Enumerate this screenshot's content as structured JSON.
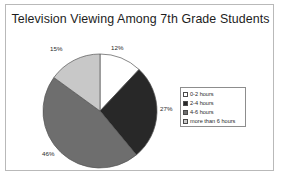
{
  "chart_data": {
    "type": "pie",
    "title": "Television Viewing Among 7th Grade Students",
    "xlabel": "",
    "ylabel": "",
    "legend_position": "right",
    "grid": false,
    "categories": [
      "0-2 hours",
      "2-4 hours",
      "4-6 hours",
      "more than 6 hours"
    ],
    "values": [
      12,
      27,
      46,
      15
    ],
    "value_labels": [
      "12%",
      "27%",
      "46%",
      "15%"
    ],
    "colors": [
      "#ffffff",
      "#282828",
      "#6e6e6e",
      "#c8c8c8"
    ],
    "slices": [
      {
        "label": "0-2 hours",
        "value": 12,
        "display": "12%",
        "color": "#ffffff"
      },
      {
        "label": "2-4 hours",
        "value": 27,
        "display": "27%",
        "color": "#282828"
      },
      {
        "label": "4-6 hours",
        "value": 46,
        "display": "46%",
        "color": "#6e6e6e"
      },
      {
        "label": "more than 6 hours",
        "value": 15,
        "display": "15%",
        "color": "#c8c8c8"
      }
    ]
  },
  "legend": {
    "items": [
      {
        "label": "0-2 hours"
      },
      {
        "label": "2-4 hours"
      },
      {
        "label": "4-6 hours"
      },
      {
        "label": "more than 6 hours"
      }
    ]
  }
}
